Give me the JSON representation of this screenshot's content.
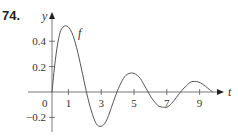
{
  "problem_number": "74.",
  "chart_data": {
    "type": "line",
    "title": "",
    "xlabel": "t",
    "ylabel": "y",
    "curve_label": "f",
    "xlim": [
      0,
      10.3
    ],
    "ylim": [
      -0.3,
      0.58
    ],
    "xticks": [
      1,
      3,
      5,
      7,
      9
    ],
    "xtick_labels": [
      "1",
      "3",
      "5",
      "7",
      "9"
    ],
    "yticks": [
      0.4,
      0.2,
      -0.2
    ],
    "ytick_labels": [
      "0.4",
      "0.2",
      "−0.2"
    ],
    "origin_label": "0",
    "grid": false,
    "series": [
      {
        "name": "f",
        "x": [
          0,
          0.2,
          0.4,
          0.6,
          0.9,
          1.2,
          1.5,
          1.8,
          2.1,
          2.4,
          2.7,
          3.0,
          3.3,
          3.6,
          3.9,
          4.2,
          4.5,
          4.9,
          5.3,
          5.6,
          5.9,
          6.2,
          6.5,
          6.8,
          7.0,
          7.3,
          7.6,
          7.9,
          8.2,
          8.5,
          8.9,
          9.2,
          9.5,
          9.8
        ],
        "y": [
          0,
          0.25,
          0.42,
          0.5,
          0.52,
          0.47,
          0.35,
          0.18,
          0.0,
          -0.15,
          -0.25,
          -0.27,
          -0.23,
          -0.13,
          -0.02,
          0.07,
          0.13,
          0.15,
          0.12,
          0.06,
          -0.01,
          -0.07,
          -0.11,
          -0.12,
          -0.12,
          -0.09,
          -0.04,
          0.01,
          0.05,
          0.08,
          0.08,
          0.06,
          0.03,
          0.0
        ]
      }
    ]
  }
}
